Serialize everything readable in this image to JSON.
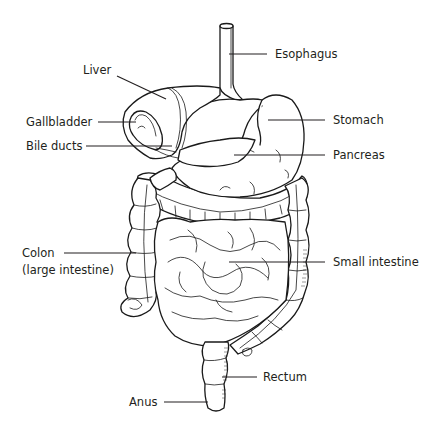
{
  "diagram": {
    "labels": {
      "esophagus": "Esophagus",
      "liver": "Liver",
      "stomach": "Stomach",
      "gallbladder": "Gallbladder",
      "bile_ducts": "Bile ducts",
      "pancreas": "Pancreas",
      "colon": "Colon",
      "colon_sub": "(large intestine)",
      "small_intestine": "Small intestine",
      "rectum": "Rectum",
      "anus": "Anus"
    },
    "colors": {
      "ink": "#231f20",
      "background": "#ffffff"
    }
  }
}
